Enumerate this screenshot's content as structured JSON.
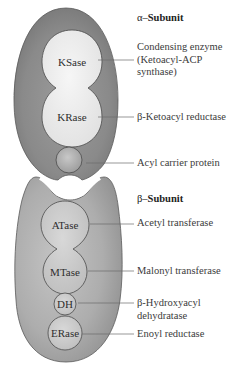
{
  "diagram": {
    "colors": {
      "subunit_fill": "#8a8a8a",
      "subunit_dark": "#6e6e6e",
      "domain_fill": "#ededed",
      "beta_fill": "#a9a9a9",
      "stroke": "#4a4a4a",
      "leader_line": "#6a6a6a"
    },
    "alpha": {
      "header_prefix": "α–",
      "header": "Subunit",
      "domains": [
        {
          "id": "ksase",
          "label": "KSase"
        },
        {
          "id": "krase",
          "label": "KRase"
        },
        {
          "id": "acp",
          "label": ""
        }
      ],
      "labels": [
        {
          "lines": [
            "Condensing enzyme",
            "(Ketoacyl-ACP",
            "synthase)"
          ]
        },
        {
          "lines": [
            "β-Ketoacyl reductase"
          ]
        },
        {
          "lines": [
            "Acyl carrier protein"
          ]
        }
      ]
    },
    "beta": {
      "header_prefix": "β–",
      "header": "Subunit",
      "domains": [
        {
          "id": "atase",
          "label": "ATase"
        },
        {
          "id": "mtase",
          "label": "MTase"
        },
        {
          "id": "dh",
          "label": "DH"
        },
        {
          "id": "erase",
          "label": "ERase"
        }
      ],
      "labels": [
        {
          "lines": [
            "Acetyl transferase"
          ]
        },
        {
          "lines": [
            "Malonyl transferase"
          ]
        },
        {
          "lines": [
            "β-Hydroxyacyl",
            "dehydratase"
          ]
        },
        {
          "lines": [
            "Enoyl reductase"
          ]
        }
      ]
    }
  }
}
